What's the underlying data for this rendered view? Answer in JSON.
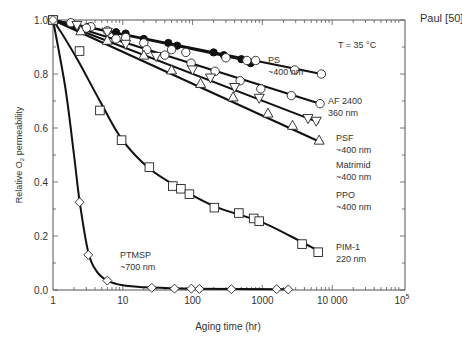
{
  "chart_data": {
    "type": "line",
    "title": "",
    "source_label": "Paul [50]",
    "annotation": "T = 35 °C",
    "xlabel": "Aging time (hr)",
    "ylabel": "Relative O2 permeability",
    "ylabel_parts": {
      "pre": "Relative O",
      "sub": "2",
      "post": " permeability"
    },
    "xscale": "log",
    "xlim": [
      1,
      100000
    ],
    "ylim": [
      0.0,
      1.0
    ],
    "grid": false,
    "x_ticks": [
      {
        "value": 1,
        "label": "1"
      },
      {
        "value": 10,
        "label": "10"
      },
      {
        "value": 100,
        "label": "100"
      },
      {
        "value": 1000,
        "label": "1000"
      },
      {
        "value": 10000,
        "label": "10 000"
      },
      {
        "value": 100000,
        "label": "10",
        "sup": "5"
      }
    ],
    "y_ticks": [
      {
        "value": 0.0,
        "label": "0.0"
      },
      {
        "value": 0.2,
        "label": "0.2"
      },
      {
        "value": 0.4,
        "label": "0.4"
      },
      {
        "value": 0.6,
        "label": "0.6"
      },
      {
        "value": 0.8,
        "label": "0.8"
      },
      {
        "value": 1.0,
        "label": "1.0"
      }
    ],
    "series": [
      {
        "name": "PS",
        "label_lines": [
          "PS",
          "~400 nm"
        ],
        "marker": "filled-circle",
        "points": [
          [
            1,
            1.0
          ],
          [
            3.2,
            0.975
          ],
          [
            8,
            0.955
          ],
          [
            11,
            0.95
          ],
          [
            20,
            0.93
          ],
          [
            45,
            0.915
          ],
          [
            60,
            0.905
          ],
          [
            200,
            0.88
          ],
          [
            280,
            0.87
          ],
          [
            500,
            0.855
          ],
          [
            680,
            0.84
          ]
        ],
        "fit": [
          [
            1,
            1.0
          ],
          [
            900,
            0.84
          ]
        ]
      },
      {
        "name": "AF 2400",
        "label_lines": [
          "AF 2400",
          "360 nm"
        ],
        "marker": "open-circle",
        "points": [
          [
            1,
            1.0
          ],
          [
            1.8,
            0.99
          ],
          [
            3.5,
            0.975
          ],
          [
            6,
            0.96
          ],
          [
            11,
            0.935
          ],
          [
            20,
            0.915
          ],
          [
            50,
            0.89
          ],
          [
            80,
            0.88
          ],
          [
            300,
            0.86
          ],
          [
            600,
            0.85
          ],
          [
            800,
            0.85
          ],
          [
            2900,
            0.815
          ],
          [
            7000,
            0.8
          ]
        ],
        "fit": [
          [
            1,
            1.0
          ],
          [
            7000,
            0.8
          ]
        ]
      },
      {
        "name": "PSF",
        "label_lines": [
          "PSF",
          "~400 nm"
        ],
        "marker": "open-circle",
        "points": [
          [
            1,
            1.0
          ],
          [
            3,
            0.97
          ],
          [
            8,
            0.93
          ],
          [
            22,
            0.89
          ],
          [
            40,
            0.87
          ],
          [
            95,
            0.84
          ],
          [
            210,
            0.81
          ],
          [
            480,
            0.775
          ],
          [
            950,
            0.745
          ],
          [
            2600,
            0.72
          ],
          [
            6700,
            0.69
          ]
        ],
        "fit": [
          [
            1,
            1.0
          ],
          [
            6700,
            0.69
          ]
        ]
      },
      {
        "name": "Matrimid",
        "label_lines": [
          "Matrimid",
          "~400 nm"
        ],
        "marker": "open-triangle-down",
        "points": [
          [
            1,
            1.0
          ],
          [
            2.2,
            0.98
          ],
          [
            6,
            0.955
          ],
          [
            11,
            0.91
          ],
          [
            30,
            0.865
          ],
          [
            100,
            0.815
          ],
          [
            180,
            0.785
          ],
          [
            400,
            0.75
          ],
          [
            900,
            0.71
          ],
          [
            4500,
            0.635
          ],
          [
            5900,
            0.625
          ]
        ],
        "fit": [
          [
            1,
            1.0
          ],
          [
            6500,
            0.62
          ]
        ]
      },
      {
        "name": "PPO",
        "label_lines": [
          "PPO",
          "~400 nm"
        ],
        "marker": "open-triangle-up",
        "points": [
          [
            1,
            1.0
          ],
          [
            2.5,
            0.96
          ],
          [
            6,
            0.925
          ],
          [
            20,
            0.87
          ],
          [
            50,
            0.815
          ],
          [
            130,
            0.765
          ],
          [
            380,
            0.715
          ],
          [
            1200,
            0.655
          ],
          [
            2700,
            0.61
          ],
          [
            6500,
            0.555
          ]
        ],
        "fit": [
          [
            1,
            1.0
          ],
          [
            6500,
            0.55
          ]
        ]
      },
      {
        "name": "PIM-1",
        "label_lines": [
          "PIM-1",
          "220 nm"
        ],
        "marker": "open-square",
        "points": [
          [
            1,
            1.0
          ],
          [
            2.4,
            0.885
          ],
          [
            4.7,
            0.665
          ],
          [
            9.6,
            0.555
          ],
          [
            24,
            0.455
          ],
          [
            52,
            0.385
          ],
          [
            68,
            0.375
          ],
          [
            90,
            0.355
          ],
          [
            205,
            0.305
          ],
          [
            460,
            0.285
          ],
          [
            750,
            0.265
          ],
          [
            900,
            0.255
          ],
          [
            3700,
            0.17
          ],
          [
            6300,
            0.14
          ]
        ],
        "fit": [
          [
            1,
            1.0
          ],
          [
            1.5,
            0.93
          ],
          [
            2.4,
            0.84
          ],
          [
            4.7,
            0.7
          ],
          [
            9.6,
            0.56
          ],
          [
            24,
            0.45
          ],
          [
            68,
            0.375
          ],
          [
            205,
            0.31
          ],
          [
            900,
            0.255
          ],
          [
            2500,
            0.2
          ],
          [
            6300,
            0.145
          ]
        ]
      },
      {
        "name": "PTMSP",
        "label_lines": [
          "PTMSP",
          "~700 nm"
        ],
        "marker": "open-diamond",
        "points": [
          [
            1,
            1.0
          ],
          [
            2.4,
            0.325
          ],
          [
            3.2,
            0.13
          ],
          [
            6,
            0.035
          ],
          [
            26,
            0.008
          ],
          [
            55,
            0.005
          ],
          [
            96,
            0.005
          ],
          [
            125,
            0.004
          ],
          [
            360,
            0.003
          ],
          [
            1600,
            0.003
          ],
          [
            2350,
            0.002
          ]
        ],
        "fit": [
          [
            1,
            1.0
          ],
          [
            1.5,
            0.75
          ],
          [
            2,
            0.5
          ],
          [
            2.4,
            0.33
          ],
          [
            3.2,
            0.14
          ],
          [
            4.2,
            0.07
          ],
          [
            6,
            0.035
          ],
          [
            10,
            0.018
          ],
          [
            26,
            0.009
          ],
          [
            100,
            0.005
          ],
          [
            2350,
            0.003
          ]
        ]
      }
    ]
  }
}
